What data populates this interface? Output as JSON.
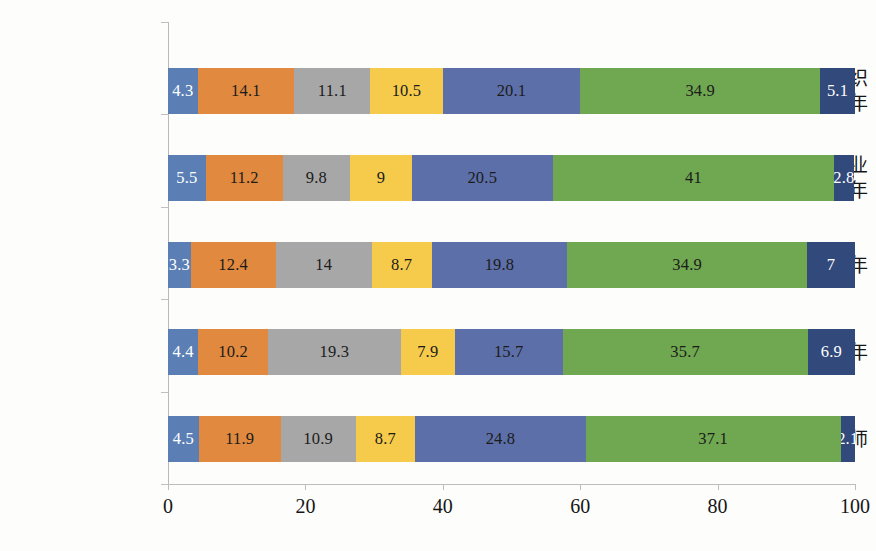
{
  "chart_data": {
    "type": "bar",
    "orientation": "horizontal",
    "stacked": true,
    "normalized_percent": true,
    "title": "",
    "subtitle": "",
    "xlabel": "",
    "ylabel": "",
    "xlim": [
      0,
      100
    ],
    "xticks": [
      0,
      20,
      40,
      60,
      80,
      100
    ],
    "xtick_labels": [
      "0",
      "20",
      "40",
      "60",
      "80",
      "100"
    ],
    "grid": false,
    "legend": false,
    "legend_position": "none",
    "annotations": [],
    "categories": [
      "社会组织从业青年",
      "行政事业单位青年",
      "企业从业青年",
      "农业青年",
      "青年教师"
    ],
    "category_lines": [
      [
        "社会组织",
        "从业青年"
      ],
      [
        "行政事业",
        "单位青年"
      ],
      [
        "企业从业青年"
      ],
      [
        "农业青年"
      ],
      [
        "青年教师"
      ]
    ],
    "series": [
      {
        "name": "series-1",
        "color": "#5B7FB5",
        "text_color": "light",
        "values": [
          4.3,
          5.5,
          3.3,
          4.4,
          4.5
        ],
        "labels": [
          "4.3",
          "5.5",
          "3.3",
          "4.4",
          "4.5"
        ]
      },
      {
        "name": "series-2",
        "color": "#E18A3F",
        "text_color": "dark",
        "values": [
          14.1,
          11.2,
          12.4,
          10.2,
          11.9
        ],
        "labels": [
          "14.1",
          "11.2",
          "12.4",
          "10.2",
          "11.9"
        ]
      },
      {
        "name": "series-3",
        "color": "#A7A7A7",
        "text_color": "dark",
        "values": [
          11.1,
          9.8,
          14.0,
          19.3,
          10.9
        ],
        "labels": [
          "11.1",
          "9.8",
          "14",
          "19.3",
          "10.9"
        ]
      },
      {
        "name": "series-4",
        "color": "#F6CB4C",
        "text_color": "dark",
        "values": [
          10.5,
          9.0,
          8.7,
          7.9,
          8.7
        ],
        "labels": [
          "10.5",
          "9",
          "8.7",
          "7.9",
          "8.7"
        ]
      },
      {
        "name": "series-5",
        "color": "#5C6FA8",
        "text_color": "dark",
        "values": [
          20.1,
          20.5,
          19.8,
          15.7,
          24.8
        ],
        "labels": [
          "20.1",
          "20.5",
          "19.8",
          "15.7",
          "24.8"
        ]
      },
      {
        "name": "series-6",
        "color": "#70A751",
        "text_color": "dark",
        "values": [
          34.9,
          41.0,
          34.9,
          35.7,
          37.1
        ],
        "labels": [
          "34.9",
          "41",
          "34.9",
          "35.7",
          "37.1"
        ]
      },
      {
        "name": "series-7",
        "color": "#32497B",
        "text_color": "light",
        "values": [
          5.1,
          2.8,
          7.0,
          6.9,
          2.1
        ],
        "labels": [
          "5.1",
          "2.8",
          "7",
          "6.9",
          "2.1"
        ]
      }
    ]
  }
}
